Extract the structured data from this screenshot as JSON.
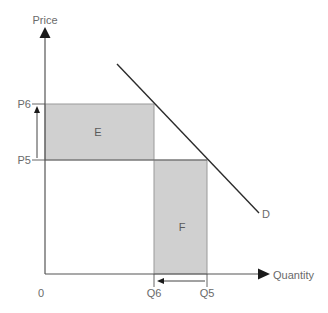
{
  "diagram": {
    "type": "supply-demand",
    "axes": {
      "y_label": "Price",
      "x_label": "Quantity",
      "origin_label": "0"
    },
    "price_levels": [
      {
        "label": "P6",
        "y": 104
      },
      {
        "label": "P5",
        "y": 160
      }
    ],
    "quantity_levels": [
      {
        "label": "Q6",
        "x": 154
      },
      {
        "label": "Q5",
        "x": 207
      }
    ],
    "areas": [
      {
        "label": "E",
        "fill": "#d0d0d0"
      },
      {
        "label": "F",
        "fill": "#d0d0d0"
      }
    ],
    "curves": [
      {
        "label": "D",
        "color": "#2b2b2b"
      }
    ],
    "annotations": {
      "price_arrow": "P5 to P6 (price rises)",
      "quantity_arrow": "Q5 to Q6 (quantity falls)"
    }
  }
}
